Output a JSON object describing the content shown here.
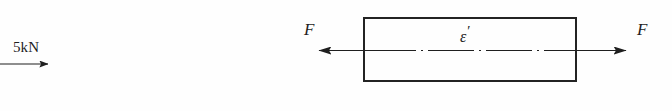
{
  "figure": {
    "background_color": "#fefefe",
    "ink_color": "#1f1f1f",
    "rule_color": "#232323",
    "width": 672,
    "height": 111
  },
  "left_diagram": {
    "name": "point-load-callout",
    "load_label": "5kN",
    "arrow_direction": "right",
    "arrow_icon": "arrow-right-icon"
  },
  "right_diagram": {
    "name": "axially-loaded-bar",
    "body_shape": "rectangle",
    "centerline_style": "dash-dot",
    "centerline_icon": "centerline-dash-dot-icon",
    "strain_label": "ε",
    "strain_prime": "′",
    "force_label_left": "F",
    "force_label_right": "F",
    "left_arrow_direction": "left",
    "right_arrow_direction": "right",
    "left_arrow_icon": "arrow-left-icon",
    "right_arrow_icon": "arrow-right-icon"
  }
}
